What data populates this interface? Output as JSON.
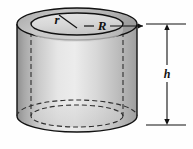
{
  "figure": {
    "name": "hollow-cylinder-diagram",
    "labels": {
      "inner_radius": "r",
      "outer_radius": "R",
      "height": "h"
    },
    "colors": {
      "outline": "#111111",
      "hidden_edge": "#3a3a3a",
      "body_light": "#ececec",
      "body_mid": "#d2d2d2",
      "body_dark": "#9a9a9a",
      "top_ring": "#b9b9b9",
      "hole_face": "#dcdcdc",
      "background": "#fefefe"
    },
    "geometry": {
      "outer_ellipse_rx": 60,
      "outer_ellipse_ry": 16,
      "inner_ellipse_rx": 46,
      "inner_ellipse_ry": 11,
      "top_center_y": 24,
      "bottom_center_y": 116,
      "center_x": 77
    },
    "dimension_line": {
      "label": "h",
      "top_y": 24,
      "bottom_y": 125,
      "x": 167,
      "arrowheads": "both"
    },
    "leader_lines": [
      {
        "label": "r",
        "from": "hole-center",
        "to": "inner-ellipse-upper-left"
      },
      {
        "label": "R",
        "from": "hole-center",
        "to": "outer-ellipse-right"
      }
    ]
  }
}
